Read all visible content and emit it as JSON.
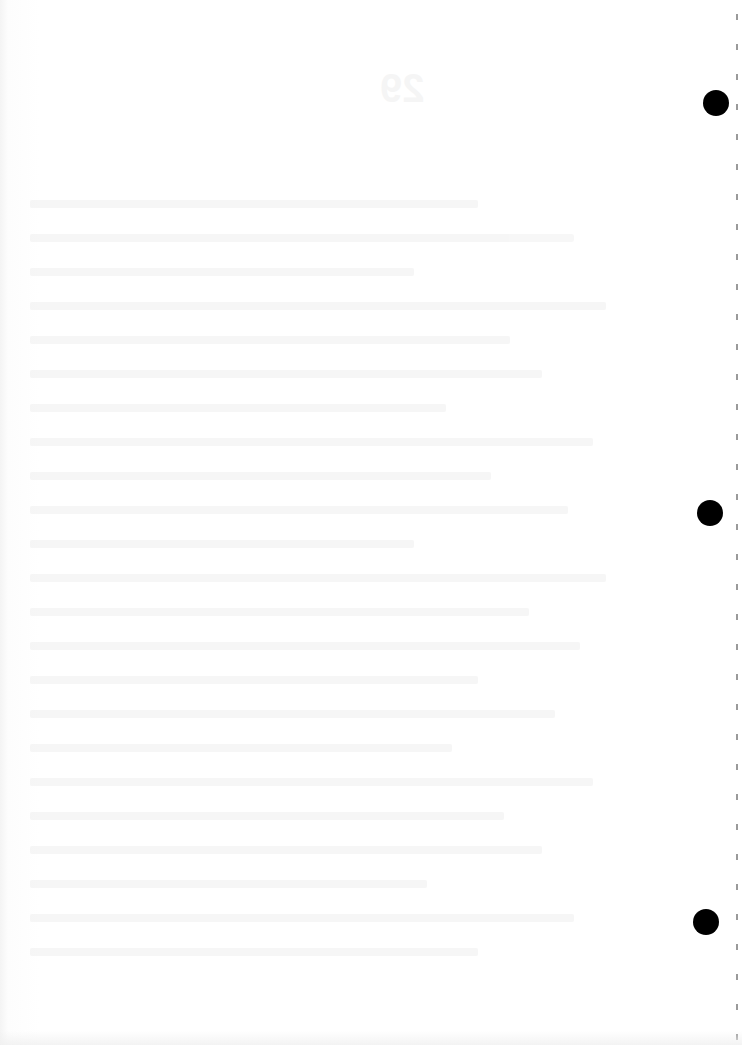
{
  "document": {
    "type": "scanned blank page",
    "show_through": {
      "number": "29",
      "heading": "",
      "legible": false
    },
    "punch_holes": [
      {
        "x": 716,
        "y": 103,
        "diameter": 26
      },
      {
        "x": 710,
        "y": 513,
        "diameter": 26
      },
      {
        "x": 706,
        "y": 922,
        "diameter": 26
      }
    ],
    "colors": {
      "paper": "#ffffff",
      "hole": "#000000",
      "perforation": "#9a9a9a"
    }
  }
}
